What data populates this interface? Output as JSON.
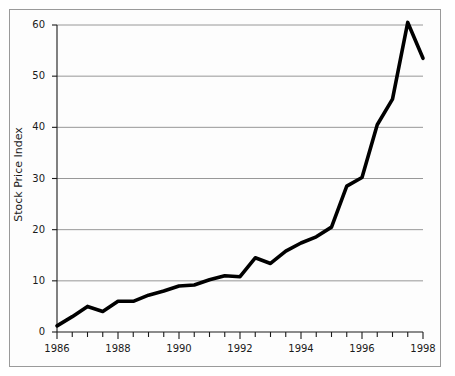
{
  "figure": {
    "background_color": "#ffffff",
    "frame_color": "#9a9a9a",
    "gridline_color": "#8c8c8c",
    "axis_color": "#1a1a1a",
    "line_color": "#000000"
  },
  "chart_data": {
    "type": "line",
    "title": "",
    "xlabel": "",
    "ylabel": "Stock Price Index",
    "xlim": [
      1986,
      1998
    ],
    "ylim": [
      0,
      62
    ],
    "grid": true,
    "legend": "none",
    "y_ticks": [
      0,
      10,
      20,
      30,
      40,
      50,
      60
    ],
    "y_tick_labels": [
      "0",
      "10",
      "20",
      "30",
      "40",
      "50",
      "60"
    ],
    "x_major_ticks": [
      1986,
      1988,
      1990,
      1992,
      1994,
      1996,
      1998
    ],
    "x_major_tick_labels": [
      "1986",
      "1988",
      "1990",
      "1992",
      "1994",
      "1996",
      "1998"
    ],
    "x_minor_tick_interval": 0.5,
    "series": [
      {
        "name": "Stock Price Index",
        "x": [
          1986,
          1986.5,
          1987,
          1987.5,
          1988,
          1988.5,
          1989,
          1989.5,
          1990,
          1990.5,
          1991,
          1991.5,
          1992,
          1992.5,
          1993,
          1993.5,
          1994,
          1994.5,
          1995,
          1995.5,
          1996,
          1996.5,
          1997,
          1997.5,
          1998
        ],
        "values": [
          1.2,
          3.0,
          5.0,
          4.0,
          6.0,
          6.0,
          7.2,
          8.0,
          9.0,
          9.2,
          10.2,
          11.0,
          10.8,
          14.5,
          13.4,
          15.8,
          17.4,
          18.6,
          20.5,
          28.5,
          30.2,
          40.5,
          45.5,
          60.5,
          53.5
        ]
      }
    ]
  },
  "axes": {
    "ylabel_text": "Stock Price Index"
  }
}
